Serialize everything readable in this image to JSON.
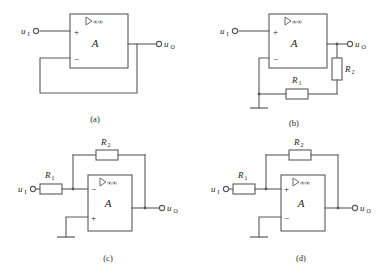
{
  "figure": {
    "stroke_color": "#5a5a5a",
    "text_color": "#231f20",
    "background_color": "#ffffff"
  },
  "common": {
    "opamp_gain_label": "A",
    "opamp_ideal_symbol": "▷∞",
    "plus_sign": "+",
    "minus_sign": "−",
    "input_label": "u",
    "input_subscript": "I",
    "output_label": "u",
    "output_subscript": "O",
    "resistor1_label": "R",
    "resistor1_subscript": "1",
    "resistor2_label": "R",
    "resistor2_subscript": "2"
  },
  "panels": [
    {
      "id": "a",
      "caption": "(a)",
      "name": "voltage-follower",
      "input_terminal_label": "u",
      "input_terminal_sub": "I",
      "output_terminal_label": "u",
      "output_terminal_sub": "O",
      "opamp": {
        "gain": "A",
        "ideal": "▷∞",
        "top_terminal_sign": "+",
        "bottom_terminal_sign": "−"
      },
      "resistors": [],
      "has_ground": false
    },
    {
      "id": "b",
      "caption": "(b)",
      "name": "non-inverting-amplifier",
      "input_terminal_label": "u",
      "input_terminal_sub": "I",
      "output_terminal_label": "u",
      "output_terminal_sub": "O",
      "opamp": {
        "gain": "A",
        "ideal": "▷∞",
        "top_terminal_sign": "+",
        "bottom_terminal_sign": "−"
      },
      "resistors": [
        {
          "label": "R",
          "sub": "1",
          "orientation": "horizontal",
          "position": "feedback-bottom"
        },
        {
          "label": "R",
          "sub": "2",
          "orientation": "vertical",
          "position": "output-leg"
        }
      ],
      "has_ground": true
    },
    {
      "id": "c",
      "caption": "(c)",
      "name": "inverting-amplifier",
      "input_terminal_label": "u",
      "input_terminal_sub": "I",
      "output_terminal_label": "u",
      "output_terminal_sub": "O",
      "opamp": {
        "gain": "A",
        "ideal": "▷∞",
        "top_terminal_sign": "−",
        "bottom_terminal_sign": "+"
      },
      "resistors": [
        {
          "label": "R",
          "sub": "1",
          "orientation": "horizontal",
          "position": "input-series"
        },
        {
          "label": "R",
          "sub": "2",
          "orientation": "horizontal",
          "position": "feedback-top"
        }
      ],
      "has_ground": true
    },
    {
      "id": "d",
      "caption": "(d)",
      "name": "positive-feedback-amplifier",
      "input_terminal_label": "u",
      "input_terminal_sub": "I",
      "output_terminal_label": "u",
      "output_terminal_sub": "O",
      "opamp": {
        "gain": "A",
        "ideal": "▷∞",
        "top_terminal_sign": "+",
        "bottom_terminal_sign": "−"
      },
      "resistors": [
        {
          "label": "R",
          "sub": "1",
          "orientation": "horizontal",
          "position": "input-series"
        },
        {
          "label": "R",
          "sub": "2",
          "orientation": "horizontal",
          "position": "feedback-top"
        }
      ],
      "has_ground": true
    }
  ]
}
